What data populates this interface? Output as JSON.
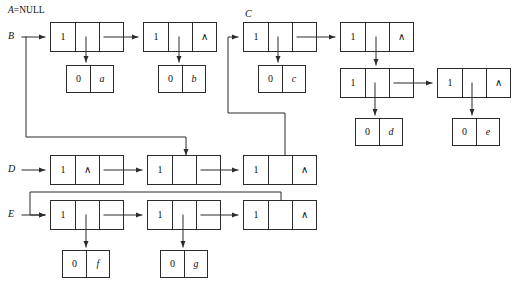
{
  "figure": {
    "kind": "generalized-list-storage-diagram",
    "background": "#ffffff",
    "ink": "#2b2b2b",
    "width": 512,
    "height": 290
  },
  "labels": {
    "a_null": {
      "name": "A",
      "eq": "=NULL",
      "x": 8,
      "y": 6
    },
    "c_head": {
      "text": "C",
      "x": 245,
      "y": 9
    },
    "b": {
      "text": "B",
      "x": 8,
      "y": 29
    },
    "d": {
      "text": "D",
      "x": 8,
      "y": 163
    },
    "e": {
      "text": "E",
      "x": 8,
      "y": 208
    }
  },
  "glyphs": {
    "tag_list": "1",
    "tag_atom": "0",
    "nil": "∧"
  },
  "nodes": [
    {
      "id": "b1",
      "type": "list",
      "x": 50,
      "y": 22,
      "cells": [
        "1",
        "",
        ""
      ]
    },
    {
      "id": "b2",
      "type": "list",
      "x": 143,
      "y": 22,
      "cells": [
        "1",
        "",
        "∧"
      ]
    },
    {
      "id": "c1",
      "type": "list",
      "x": 243,
      "y": 22,
      "cells": [
        "1",
        "",
        ""
      ]
    },
    {
      "id": "c2",
      "type": "list",
      "x": 340,
      "y": 22,
      "cells": [
        "1",
        "",
        "∧"
      ]
    },
    {
      "id": "c3",
      "type": "list",
      "x": 340,
      "y": 68,
      "cells": [
        "1",
        "",
        ""
      ]
    },
    {
      "id": "c4",
      "type": "list",
      "x": 437,
      "y": 68,
      "cells": [
        "1",
        "",
        "∧"
      ]
    },
    {
      "id": "d1",
      "type": "list",
      "x": 50,
      "y": 155,
      "cells": [
        "1",
        "∧",
        ""
      ]
    },
    {
      "id": "d2",
      "type": "list",
      "x": 147,
      "y": 155,
      "cells": [
        "1",
        "",
        ""
      ]
    },
    {
      "id": "d3",
      "type": "list",
      "x": 243,
      "y": 155,
      "cells": [
        "1",
        "",
        "∧"
      ]
    },
    {
      "id": "e1",
      "type": "list",
      "x": 50,
      "y": 200,
      "cells": [
        "1",
        "",
        ""
      ]
    },
    {
      "id": "e2",
      "type": "list",
      "x": 147,
      "y": 200,
      "cells": [
        "1",
        "",
        ""
      ]
    },
    {
      "id": "e3",
      "type": "list",
      "x": 243,
      "y": 200,
      "cells": [
        "1",
        "",
        "∧"
      ]
    }
  ],
  "atoms": [
    {
      "id": "atom-a",
      "x": 66,
      "y": 65,
      "tag": "0",
      "value": "a"
    },
    {
      "id": "atom-b",
      "x": 158,
      "y": 65,
      "tag": "0",
      "value": "b"
    },
    {
      "id": "atom-c",
      "x": 258,
      "y": 65,
      "tag": "0",
      "value": "c"
    },
    {
      "id": "atom-d",
      "x": 355,
      "y": 118,
      "tag": "0",
      "value": "d"
    },
    {
      "id": "atom-e",
      "x": 452,
      "y": 118,
      "tag": "0",
      "value": "e"
    },
    {
      "id": "atom-f",
      "x": 62,
      "y": 250,
      "tag": "0",
      "value": "f"
    },
    {
      "id": "atom-g",
      "x": 160,
      "y": 250,
      "tag": "0",
      "value": "g"
    }
  ],
  "connectors": [
    {
      "name": "b-entry-arrow",
      "d": "M22,37 L45,37"
    },
    {
      "name": "b1-next-arrow",
      "d": "M104,37 L138,37"
    },
    {
      "name": "b1-down-to-atom-a",
      "d": "M86,37 L86,62"
    },
    {
      "name": "b2-down-to-atom-b",
      "d": "M179,37 L179,62"
    },
    {
      "name": "b-shared-down-path",
      "d": "M26,37 L26,137 L186,137 L186,155"
    },
    {
      "name": "c-loop-from-d3",
      "d": "M285,155 L285,113 L228,113 L228,37 L238,37"
    },
    {
      "name": "c1-next-arrow",
      "d": "M297,37 L335,37"
    },
    {
      "name": "c1-down-to-atom-c",
      "d": "M278,37 L278,62"
    },
    {
      "name": "c2-down-to-c3",
      "d": "M376,37 L376,65"
    },
    {
      "name": "c3-down-to-atom-d",
      "d": "M375,83 L375,115"
    },
    {
      "name": "c3-next-arrow",
      "d": "M394,83 L432,83"
    },
    {
      "name": "c4-down-to-atom-e",
      "d": "M472,83 L472,115"
    },
    {
      "name": "d-entry-arrow",
      "d": "M22,170 L45,170"
    },
    {
      "name": "d1-next-arrow",
      "d": "M104,170 L142,170"
    },
    {
      "name": "d2-next-arrow",
      "d": "M201,170 L238,170"
    },
    {
      "name": "e-entry-arrow",
      "d": "M22,215 L45,215"
    },
    {
      "name": "e1-next-arrow",
      "d": "M104,215 L142,215"
    },
    {
      "name": "e2-next-arrow",
      "d": "M201,215 L238,215"
    },
    {
      "name": "e1-down-to-atom-f",
      "d": "M86,215 L86,247"
    },
    {
      "name": "e2-down-to-atom-g",
      "d": "M183,215 L183,247"
    },
    {
      "name": "e-loop-from-e3",
      "d": "M281,200 L281,192 L30,192 L30,215 L45,215"
    }
  ]
}
